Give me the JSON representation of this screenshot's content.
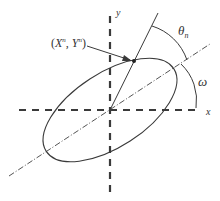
{
  "diagram": {
    "labels": {
      "y_axis": "y",
      "x_axis": "x",
      "point_x": "X",
      "point_y": "Y",
      "superscript": "n",
      "theta": "θ",
      "theta_sub": "n",
      "omega": "ω"
    },
    "colors": {
      "stroke": "#3a3a3a",
      "background": "#ffffff"
    }
  }
}
